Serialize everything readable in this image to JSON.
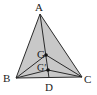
{
  "diagram": {
    "type": "geometry-triangle",
    "colors": {
      "fill": "#c8c8c8",
      "stroke": "#2a2a2a",
      "text": "#222222",
      "point": "#111111"
    },
    "points": {
      "A": {
        "label": "A"
      },
      "B": {
        "label": "B"
      },
      "C": {
        "label": "C"
      },
      "D": {
        "label": "D"
      },
      "G": {
        "label": "G"
      },
      "G2": {
        "label": "G′"
      }
    },
    "segments": [
      [
        "A",
        "B"
      ],
      [
        "B",
        "C"
      ],
      [
        "C",
        "A"
      ],
      [
        "A",
        "D"
      ],
      [
        "B",
        "G"
      ],
      [
        "C",
        "G"
      ],
      [
        "B",
        "G2"
      ],
      [
        "C",
        "G2"
      ]
    ]
  }
}
